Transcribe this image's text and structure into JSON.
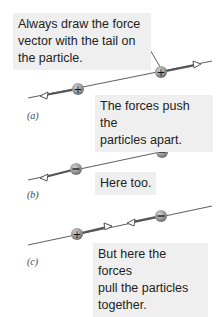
{
  "callouts": {
    "tail_note": "Always draw the force vector with the tail on the particle.",
    "panel_a_note": "The forces push the particles apart.",
    "panel_b_note": "Here too.",
    "panel_c_note": "But here the forces pull the particles together."
  },
  "tail_note_lines": [
    "Always draw the force",
    "vector with the tail on",
    "the particle."
  ],
  "panel_a_lines": [
    "The forces push the",
    "particles apart."
  ],
  "panel_c_lines": [
    "But here the forces",
    "pull the particles",
    "together."
  ],
  "panels": [
    {
      "label": "(a)",
      "charges": [
        "+",
        "+"
      ],
      "force_direction": "apart"
    },
    {
      "label": "(b)",
      "charges": [
        "−",
        "−"
      ],
      "force_direction": "apart"
    },
    {
      "label": "(c)",
      "charges": [
        "+",
        "−"
      ],
      "force_direction": "together"
    }
  ],
  "colors": {
    "callout_bg": "#efefef",
    "particle": "#9a9a9a",
    "vector": "#555555",
    "line": "#333333"
  }
}
